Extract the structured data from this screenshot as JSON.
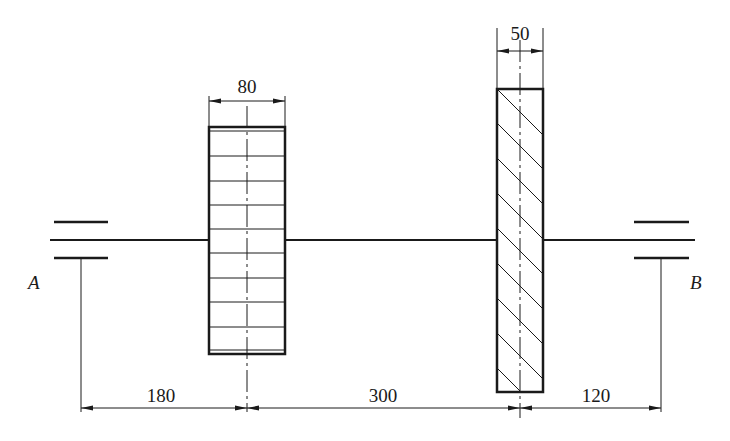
{
  "diagram": {
    "type": "shaft-assembly-drawing",
    "colors": {
      "stroke": "#1a1a1a",
      "background": "#ffffff"
    },
    "supports": [
      {
        "id": "A",
        "label": "A",
        "type": "bearing"
      },
      {
        "id": "B",
        "label": "B",
        "type": "bearing"
      }
    ],
    "components": [
      {
        "id": "gear",
        "kind": "gear",
        "width_label": "80",
        "style": "grid"
      },
      {
        "id": "pulley",
        "kind": "pulley",
        "width_label": "50",
        "style": "hatched"
      }
    ],
    "dimensions": {
      "gear_width": "80",
      "pulley_width": "50",
      "span_A_to_gear": "180",
      "span_gear_to_pulley": "300",
      "span_pulley_to_B": "120"
    }
  }
}
